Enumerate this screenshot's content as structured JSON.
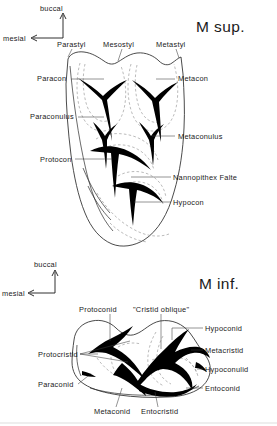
{
  "figure": {
    "kind": "anatomical-line-drawing"
  },
  "upper": {
    "title": "M sup.",
    "compass": {
      "up_label": "buccal",
      "left_label": "mesial"
    },
    "labels": {
      "parastyl": "Parastyl",
      "mesostyl": "Mesostyl",
      "metastyl": "Metastyl",
      "paracon": "Paracon",
      "metacon": "Metacon",
      "paraconulus": "Paraconulus",
      "metaconulus": "Metaconulus",
      "protocon": "Protocon",
      "nannopithex_falte": "Nannopithex Falte",
      "hypocon": "Hypocon"
    }
  },
  "lower": {
    "title": "M inf.",
    "compass": {
      "up_label": "buccal",
      "left_label": "mesial"
    },
    "labels": {
      "protoconid": "Protoconid",
      "cristid_oblique": "\"Cristid oblique\"",
      "hypoconid": "Hypoconid",
      "metacristid": "Metacristid",
      "hypoconulid": "Hypoconulid",
      "entoconid": "Entoconid",
      "protocristid": "Protocristid",
      "paraconid": "Paraconid",
      "metaconid": "Metaconid",
      "entocristid": "Entocristid"
    }
  },
  "colors": {
    "ink": "#1a1a1a",
    "outline": "#2a2a2a",
    "crest": "#000000",
    "dashed": "#8d8d8d",
    "leader": "#3a3a3a",
    "background": "#ffffff"
  }
}
